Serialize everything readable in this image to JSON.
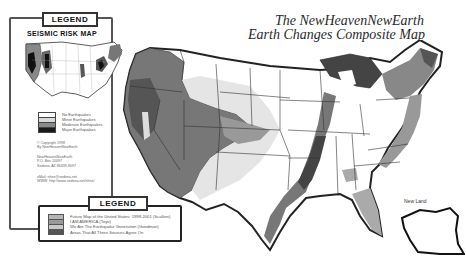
{
  "title": {
    "line1": "The NewHeavenNewEarth",
    "line2": "Earth Changes Composite Map"
  },
  "side_legend": {
    "tab_label": "LEGEND",
    "map_title": "SEISMIC RISK MAP",
    "keys": [
      {
        "label": "No Earthquakes",
        "color": "#ffffff"
      },
      {
        "label": "Minor Earthquakes",
        "color": "#d9d9d9"
      },
      {
        "label": "Moderate Earthquakes",
        "color": "#8a8a8a"
      },
      {
        "label": "Major Earthquakes",
        "color": "#1a1a1a"
      }
    ],
    "copyright": [
      "© Copyright 1998",
      "By NewHeavenNewEarth"
    ],
    "address": [
      "NewHeavenNewEarth",
      "P.O. Box 10097",
      "Sedona, AZ 86339-8097"
    ],
    "contact": [
      "eMail: nhne@sedona.net",
      "WWW: http://www.sedona.net/nhne/"
    ]
  },
  "bottom_legend": {
    "tab_label": "LEGEND",
    "keys": [
      {
        "label": "Future Map of the United States: 1998-2001 (Scallion)",
        "color": "#b5b5b5"
      },
      {
        "label": "I AM AMERICA (Toye)",
        "color": "#9a9a9a"
      },
      {
        "label": "We Are The Earthquake Generation (Goodman)",
        "color": "#c8c8c8"
      },
      {
        "label": "Areas That All Three Sources Agree On",
        "color": "#555555"
      }
    ]
  },
  "map": {
    "new_land_label": "New Land"
  }
}
